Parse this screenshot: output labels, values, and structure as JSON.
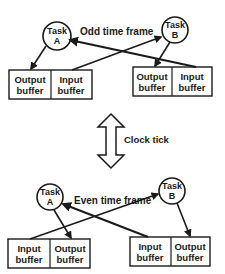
{
  "odd_frame": {
    "title": "Odd time frame",
    "task_a": {
      "line1": "Task",
      "line2": "A"
    },
    "task_b": {
      "line1": "Task",
      "line2": "B"
    },
    "left_box": {
      "left": {
        "line1": "Output",
        "line2": "buffer"
      },
      "right": {
        "line1": "Input",
        "line2": "buffer"
      }
    },
    "right_box": {
      "left": {
        "line1": "Output",
        "line2": "buffer"
      },
      "right": {
        "line1": "Input",
        "line2": "buffer"
      }
    }
  },
  "clock": {
    "label": "Clock tick"
  },
  "even_frame": {
    "title": "Even time frame",
    "task_a": {
      "line1": "Task",
      "line2": "A"
    },
    "task_b": {
      "line1": "Task",
      "line2": "B"
    },
    "left_box": {
      "left": {
        "line1": "Input",
        "line2": "buffer"
      },
      "right": {
        "line1": "Output",
        "line2": "buffer"
      }
    },
    "right_box": {
      "left": {
        "line1": "Input",
        "line2": "buffer"
      },
      "right": {
        "line1": "Output",
        "line2": "buffer"
      }
    }
  },
  "colors": {
    "ink": "#1a1a1a",
    "background": "#ffffff"
  }
}
